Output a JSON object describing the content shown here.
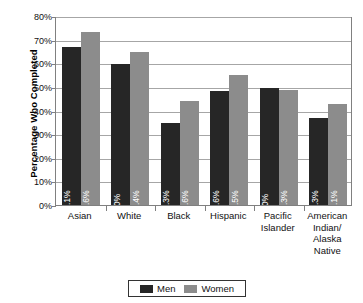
{
  "chart_data": {
    "type": "bar",
    "title": "",
    "xlabel": "",
    "ylabel": "Percentage Who Completed",
    "ylim": [
      0,
      80
    ],
    "ytick_labels": [
      "0%",
      "10%",
      "20%",
      "30%",
      "40%",
      "50%",
      "60%",
      "70%",
      "80%"
    ],
    "ytick_values": [
      0,
      10,
      20,
      30,
      40,
      50,
      60,
      70,
      80
    ],
    "grid": true,
    "legend_position": "bottom",
    "categories": [
      "Asian",
      "White",
      "Black",
      "Hispanic",
      "Pacific Islander",
      "American Indian/ Alaska Native"
    ],
    "category_lines": [
      [
        "Asian"
      ],
      [
        "White"
      ],
      [
        "Black"
      ],
      [
        "Hispanic"
      ],
      [
        "Pacific",
        "Islander"
      ],
      [
        "American",
        "Indian/",
        "Alaska",
        "Native"
      ]
    ],
    "series": [
      {
        "name": "Men",
        "color": "#262626",
        "values": [
          67.1,
          60,
          35.3,
          48.6,
          50,
          37.3
        ],
        "data_labels": [
          "67.1%",
          "60%",
          "35.3%",
          "48.6%",
          "50%",
          "37.3%"
        ]
      },
      {
        "name": "Women",
        "color": "#8c8c8c",
        "values": [
          73.6,
          65.4,
          44.6,
          55.5,
          49.3,
          43.1
        ],
        "data_labels": [
          "73.6%",
          "65.4%",
          "44.6%",
          "55.5%",
          "49.3%",
          "43.1%"
        ]
      }
    ]
  },
  "legend": {
    "items": [
      {
        "label": "Men",
        "color": "#262626"
      },
      {
        "label": "Women",
        "color": "#8c8c8c"
      }
    ]
  }
}
